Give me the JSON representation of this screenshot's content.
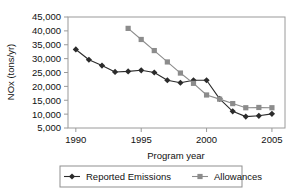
{
  "chart_data": {
    "type": "line",
    "title": "",
    "xlabel": "Program year",
    "ylabel": "NOx (tons/yr)",
    "x": [
      1990,
      1991,
      1992,
      1993,
      1994,
      1995,
      1996,
      1997,
      1998,
      1999,
      2000,
      2001,
      2002,
      2003,
      2004,
      2005
    ],
    "xlim": [
      1989.4,
      2006.0
    ],
    "ylim": [
      5000,
      45000
    ],
    "xticks": [
      1990,
      1995,
      2000,
      2005
    ],
    "xtick_labels": [
      "1990",
      "1995",
      "2000",
      "2005"
    ],
    "yticks": [
      5000,
      10000,
      15000,
      20000,
      25000,
      30000,
      35000,
      40000,
      45000
    ],
    "ytick_labels": [
      "5,000",
      "10,000",
      "15,000",
      "20,000",
      "25,000",
      "30,000",
      "35,000",
      "40,000",
      "45,000"
    ],
    "grid": false,
    "legend_position": "bottom",
    "series": [
      {
        "name": "Reported Emissions",
        "marker": "diamond",
        "color": "#2b2b2b",
        "x": [
          1990,
          1991,
          1992,
          1993,
          1994,
          1995,
          1996,
          1997,
          1998,
          1999,
          2000,
          2001,
          2002,
          2003,
          2004,
          2005
        ],
        "values": [
          33300,
          29600,
          27500,
          25200,
          25400,
          25800,
          25000,
          22200,
          21300,
          22200,
          22200,
          15500,
          11000,
          9100,
          9400,
          10100
        ]
      },
      {
        "name": "Allowances",
        "marker": "square",
        "color": "#8c8c8c",
        "x": [
          1994,
          1995,
          1996,
          1997,
          1998,
          1999,
          2000,
          2001,
          2002,
          2003,
          2004,
          2005
        ],
        "values": [
          40900,
          36900,
          32900,
          28800,
          24800,
          21100,
          16900,
          15400,
          13800,
          12300,
          12400,
          12300
        ]
      }
    ]
  },
  "legend": {
    "entries": [
      {
        "label": "Reported Emissions",
        "marker": "diamond",
        "color": "#2b2b2b"
      },
      {
        "label": "Allowances",
        "marker": "square",
        "color": "#8c8c8c"
      }
    ]
  },
  "axes": {
    "y_title": "NOx (tons/yr)",
    "x_title": "Program year"
  }
}
